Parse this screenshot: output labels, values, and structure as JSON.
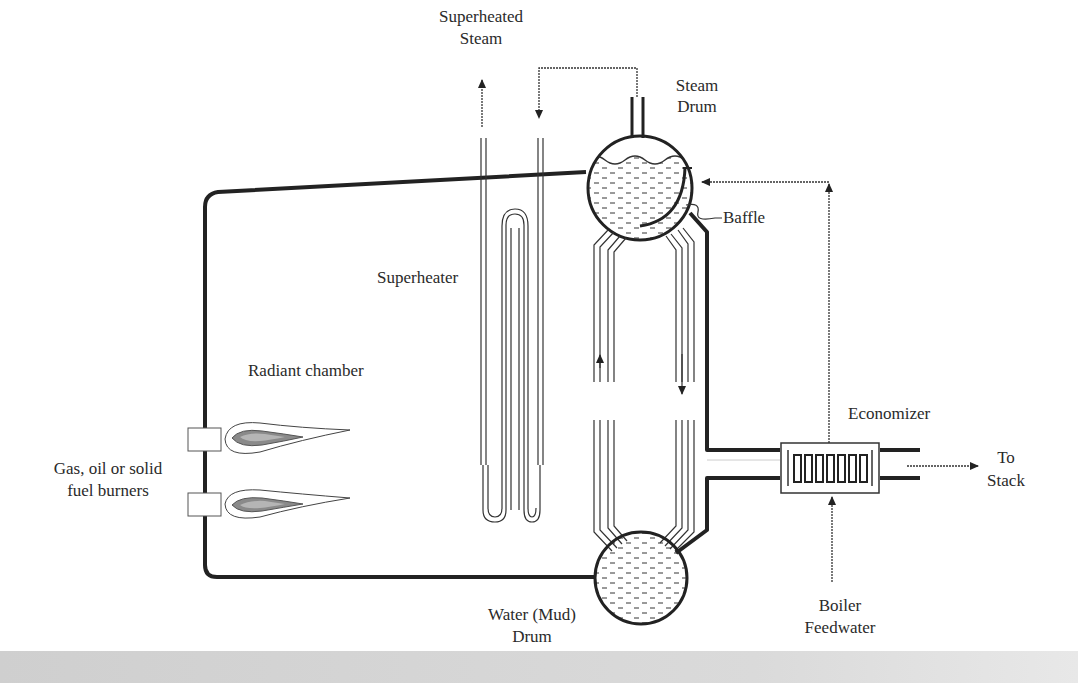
{
  "diagram": {
    "labels": {
      "superheated_steam_1": "Superheated",
      "superheated_steam_2": "Steam",
      "steam_drum_1": "Steam",
      "steam_drum_2": "Drum",
      "baffle": "Baffle",
      "superheater": "Superheater",
      "radiant_chamber": "Radiant chamber",
      "economizer": "Economizer",
      "to_stack_1": "To",
      "to_stack_2": "Stack",
      "burners_1": "Gas, oil or solid",
      "burners_2": "fuel burners",
      "water_drum_1": "Water (Mud)",
      "water_drum_2": "Drum",
      "feedwater_1": "Boiler",
      "feedwater_2": "Feedwater"
    },
    "components": [
      "Radiant chamber",
      "Burners (2)",
      "Superheater",
      "Steam Drum",
      "Baffle",
      "Riser/downcomer tubes",
      "Water (Mud) Drum",
      "Economizer",
      "Stack outlet"
    ],
    "colors": {
      "line": "#222222",
      "flame_outer": "#ffffff",
      "flame_mid": "#8a8a8a",
      "flame_core": "#b5b5b5",
      "background": "#ffffff"
    }
  }
}
